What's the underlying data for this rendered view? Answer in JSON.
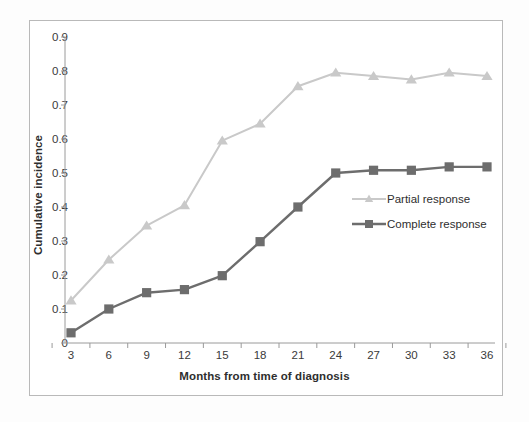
{
  "chart_data": {
    "type": "line",
    "title": "",
    "xlabel": "Months from time of diagnosis",
    "ylabel": "Cumulative incidence",
    "x": [
      3,
      6,
      9,
      12,
      15,
      18,
      21,
      24,
      27,
      30,
      33,
      36
    ],
    "xtick_labels": [
      "3",
      "6",
      "9",
      "12",
      "15",
      "18",
      "21",
      "24",
      "27",
      "30",
      "33",
      "36"
    ],
    "ytick_labels": [
      "0.9",
      "0.8",
      "0.7",
      "0.6",
      "0.5",
      "0.4",
      "0.3",
      "0.2",
      "0.1",
      "0"
    ],
    "ytick_values": [
      0.9,
      0.8,
      0.7,
      0.6,
      0.5,
      0.4,
      0.3,
      0.2,
      0.1,
      0
    ],
    "ylim": [
      0,
      0.9
    ],
    "xlim": [
      3,
      36
    ],
    "grid": false,
    "legend_position": "center-right",
    "series": [
      {
        "name": "Partial response",
        "color": "#c9c9c9",
        "marker": "triangle",
        "values": [
          0.125,
          0.245,
          0.345,
          0.405,
          0.595,
          0.645,
          0.755,
          0.795,
          0.785,
          0.775,
          0.795,
          0.785
        ]
      },
      {
        "name": "Complete response",
        "color": "#6d6d6d",
        "marker": "square",
        "values": [
          0.03,
          0.1,
          0.148,
          0.157,
          0.198,
          0.298,
          0.4,
          0.5,
          0.508,
          0.508,
          0.518,
          0.518
        ]
      }
    ]
  },
  "axis": {
    "y_title": "Cumulative incidence",
    "x_title": "Months from time of diagnosis"
  },
  "legend": {
    "items": [
      {
        "label": "Partial response"
      },
      {
        "label": "Complete response"
      }
    ]
  },
  "colors": {
    "partial": "#c9c9c9",
    "complete": "#6d6d6d",
    "axis": "#9a9a9a",
    "frame": "#b9b9b9",
    "text": "#3a3a3a",
    "background": "#fdfdfd"
  }
}
